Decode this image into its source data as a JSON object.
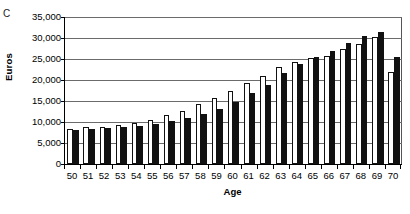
{
  "panel": {
    "letter": "C"
  },
  "chart_data": {
    "type": "bar",
    "title": "",
    "subtitle": "",
    "xlabel": "Age",
    "ylabel": "Euros",
    "categories": [
      "50",
      "51",
      "52",
      "53",
      "54",
      "55",
      "56",
      "57",
      "58",
      "59",
      "60",
      "61",
      "62",
      "63",
      "64",
      "65",
      "66",
      "67",
      "68",
      "69",
      "70"
    ],
    "ylim": [
      0,
      35000
    ],
    "ytick_values": [
      0,
      5000,
      10000,
      15000,
      20000,
      25000,
      30000,
      35000
    ],
    "ytick_labels": [
      "0",
      "5,000",
      "10,000",
      "15,000",
      "20,000",
      "25,000",
      "30,000",
      "35,000"
    ],
    "grid": true,
    "legend": "none",
    "series": [
      {
        "name": "open",
        "fill": "#ffffff",
        "edge": "#111111",
        "values": [
          8400,
          8700,
          8800,
          9300,
          9700,
          10500,
          11600,
          12700,
          14300,
          15700,
          17400,
          19300,
          21000,
          23200,
          24300,
          25300,
          25800,
          27500,
          28500,
          30200,
          22000
        ]
      },
      {
        "name": "filled",
        "fill": "#111111",
        "edge": "#111111",
        "values": [
          8200,
          8400,
          8500,
          8800,
          9000,
          9500,
          10200,
          10900,
          12000,
          13000,
          14800,
          16800,
          18800,
          21700,
          23700,
          25500,
          27000,
          28800,
          30400,
          31400,
          25400
        ]
      }
    ]
  }
}
